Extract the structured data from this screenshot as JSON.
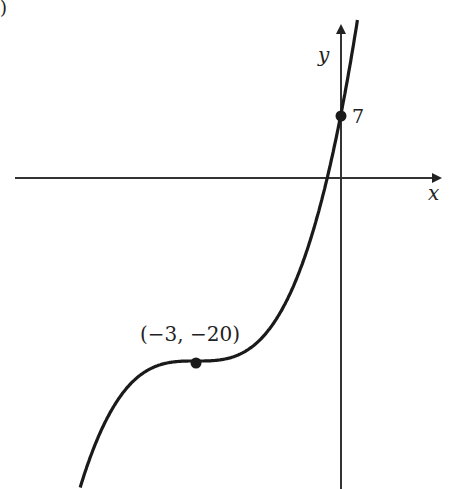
{
  "figure": {
    "part_label": ")",
    "x_axis_label": "x",
    "y_axis_label": "y",
    "y_intercept_label": "7",
    "point_label": "(−3, −20)",
    "function": "y = (x + 3)^3 - 20",
    "colors": {
      "curve": "#1a1a1a",
      "axis": "#333333",
      "background": "#ffffff"
    }
  },
  "points": [
    {
      "name": "y-intercept",
      "x": 0,
      "y": 7
    },
    {
      "name": "inflection",
      "x": -3,
      "y": -20
    }
  ]
}
